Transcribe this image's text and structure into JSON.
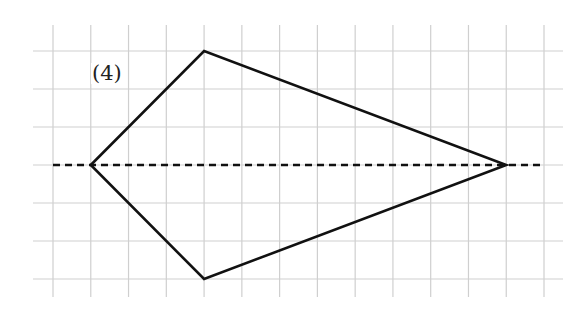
{
  "diagram": {
    "label": "(4)",
    "grid": {
      "cols": 14,
      "rows": 7,
      "origin_x": 53,
      "origin_y": 51,
      "cell_w": 37.77,
      "cell_h": 38,
      "h_line_x_start": 33,
      "h_line_x_end": 563,
      "v_line_y_start": 25,
      "v_line_y_end": 297,
      "color": "#cfcfcf"
    },
    "axis_of_symmetry": {
      "style": "dashed",
      "row": 3,
      "from_col": 0,
      "to_col": 13,
      "color": "#111111"
    },
    "shape": {
      "type": "kite",
      "color": "#111111",
      "vertices": [
        {
          "name": "left",
          "col": 1,
          "row": 3
        },
        {
          "name": "top",
          "col": 4,
          "row": 0
        },
        {
          "name": "right",
          "col": 12,
          "row": 3
        },
        {
          "name": "bottom",
          "col": 4,
          "row": 6
        }
      ]
    }
  }
}
